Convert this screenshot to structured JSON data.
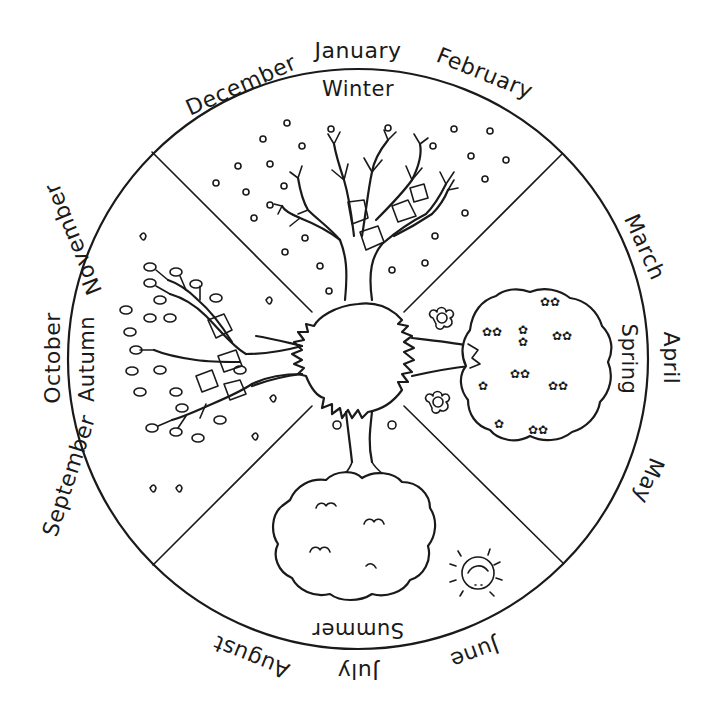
{
  "diagram": {
    "colors": {
      "line": "#1a1a1a",
      "background": "#ffffff"
    },
    "seasons": [
      {
        "name": "Winter",
        "months": [
          "December",
          "January",
          "February"
        ]
      },
      {
        "name": "Spring",
        "months": [
          "March",
          "April",
          "May"
        ]
      },
      {
        "name": "Summer",
        "months": [
          "June",
          "July",
          "August"
        ]
      },
      {
        "name": "Autumn",
        "months": [
          "September",
          "October",
          "November"
        ]
      }
    ],
    "months": {
      "december": "December",
      "january": "January",
      "february": "February",
      "march": "March",
      "april": "April",
      "may": "May",
      "june": "June",
      "july": "July",
      "august": "August",
      "september": "September",
      "october": "October",
      "november": "November"
    },
    "season_labels": {
      "winter": "Winter",
      "spring": "Spring",
      "summer": "Summer",
      "autumn": "Autumn"
    },
    "illustrations": {
      "winter": "bare-tree-with-snow",
      "spring": "blossoming-tree-with-flowers",
      "summer": "leafy-tree-with-sun",
      "autumn": "tree-with-falling-leaves",
      "center": "shared-tree-trunk-hub"
    }
  }
}
